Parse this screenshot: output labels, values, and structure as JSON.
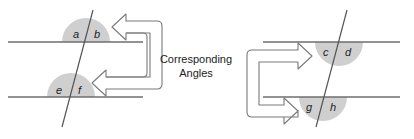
{
  "caption": {
    "line1": "Corresponding",
    "line2": "Angles"
  },
  "colors": {
    "line": "#6e6e6e",
    "angle_fill": "#cfcfcf",
    "arrow_stroke": "#7a7a7a"
  },
  "left_figure": {
    "angles": [
      {
        "label": "a"
      },
      {
        "label": "b"
      },
      {
        "label": "e"
      },
      {
        "label": "f"
      }
    ]
  },
  "right_figure": {
    "angles": [
      {
        "label": "c"
      },
      {
        "label": "d"
      },
      {
        "label": "g"
      },
      {
        "label": "h"
      }
    ]
  }
}
